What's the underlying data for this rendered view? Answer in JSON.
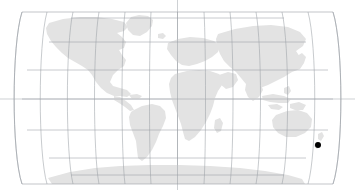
{
  "map": {
    "title": "World Map",
    "projection": "robinson",
    "background_color": "#ffffff",
    "land_color": "#e3e3e3",
    "graticule_color": "#9aa0a6",
    "axis_color": "#b9bdc2",
    "marker_color": "#000000",
    "bounds": {
      "left_px": 22,
      "right_px": 333,
      "top_px": 12,
      "bottom_px": 184,
      "center_x_px": 177.5,
      "equator_y_px": 99
    },
    "graticule": {
      "meridian_interval_degrees": 30,
      "parallel_interval_degrees": 30,
      "meridian_labels": [
        "180W",
        "150W",
        "120W",
        "90W",
        "60W",
        "30W",
        "0",
        "30E",
        "60E",
        "90E",
        "120E",
        "150E",
        "180E"
      ],
      "parallel_labels": [
        "75N",
        "60N",
        "30N",
        "0",
        "30S",
        "60S",
        "75S"
      ],
      "equator_extends_full_width": true,
      "central_meridian_extends_full_height": true
    },
    "landmasses": [
      {
        "name": "north-america"
      },
      {
        "name": "south-america"
      },
      {
        "name": "greenland"
      },
      {
        "name": "europe"
      },
      {
        "name": "africa"
      },
      {
        "name": "asia"
      },
      {
        "name": "australia"
      },
      {
        "name": "antarctica"
      },
      {
        "name": "new-zealand"
      },
      {
        "name": "madagascar"
      },
      {
        "name": "japan"
      },
      {
        "name": "british-isles"
      },
      {
        "name": "indonesia"
      },
      {
        "name": "iceland"
      }
    ],
    "markers": [
      {
        "name": "location-point",
        "x_px": 318,
        "y_px": 145,
        "radius_px": 3,
        "latitude": -45.0,
        "longitude": 172.0,
        "color": "#000000"
      }
    ]
  }
}
